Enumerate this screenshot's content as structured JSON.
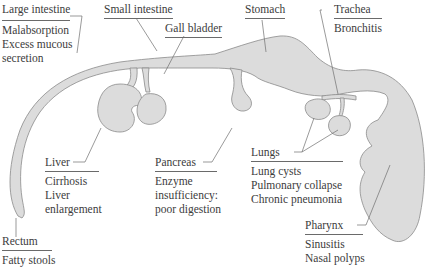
{
  "diagram": {
    "colors": {
      "organ_fill": "#dcdcdc",
      "organ_stroke": "#8a8a8a",
      "text": "#3c3c3c",
      "leader": "#6e6e6e"
    },
    "labels": {
      "large_intestine": {
        "title": "Large intestine",
        "effects": [
          "Malabsorption",
          "Excess mucous",
          "secretion"
        ]
      },
      "small_intestine": {
        "title": "Small intestine",
        "effects": []
      },
      "gall_bladder": {
        "title": "Gall bladder",
        "effects": []
      },
      "stomach": {
        "title": "Stomach",
        "effects": []
      },
      "trachea": {
        "title": "Trachea",
        "effects": [
          "Bronchitis"
        ]
      },
      "liver": {
        "title": "Liver",
        "effects": [
          "Cirrhosis",
          "Liver",
          "enlargement"
        ]
      },
      "pancreas": {
        "title": "Pancreas",
        "effects": [
          "Enzyme",
          "insufficiency:",
          "poor digestion"
        ]
      },
      "lungs": {
        "title": "Lungs",
        "effects": [
          "Lung cysts",
          "Pulmonary collapse",
          "Chronic pneumonia"
        ]
      },
      "rectum": {
        "title": "Rectum",
        "effects": [
          "Fatty stools"
        ]
      },
      "pharynx": {
        "title": "Pharynx",
        "effects": [
          "Sinusitis",
          "Nasal polyps"
        ]
      }
    }
  }
}
